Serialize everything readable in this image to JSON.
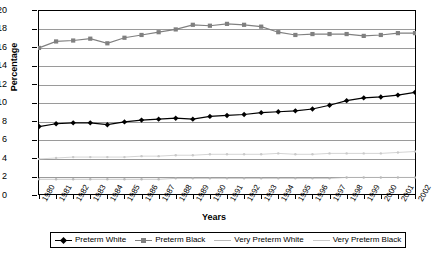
{
  "chart_data": {
    "type": "line",
    "title": "",
    "xlabel": "Years",
    "ylabel": "Percentage",
    "ylim": [
      0,
      20
    ],
    "ytick_step": 2,
    "yticks": [
      0,
      2,
      4,
      6,
      8,
      10,
      12,
      14,
      16,
      18,
      20
    ],
    "grid": true,
    "legend_position": "bottom",
    "categories": [
      "1980",
      "1981",
      "1982",
      "1983",
      "1984",
      "1985",
      "1986",
      "1987",
      "1988",
      "1989",
      "1990",
      "1991",
      "1992",
      "1993",
      "1994",
      "1995",
      "1996",
      "1997",
      "1998",
      "1999",
      "2000",
      "2001",
      "2002"
    ],
    "series": [
      {
        "name": "Preterm White",
        "color": "#000000",
        "marker": "diamond",
        "values": [
          7.4,
          7.7,
          7.8,
          7.8,
          7.6,
          7.9,
          8.1,
          8.2,
          8.3,
          8.2,
          8.5,
          8.6,
          8.7,
          8.9,
          9.0,
          9.1,
          9.3,
          9.7,
          10.2,
          10.5,
          10.6,
          10.8,
          11.1
        ]
      },
      {
        "name": "Preterm Black",
        "color": "#808080",
        "marker": "square",
        "values": [
          15.9,
          16.6,
          16.7,
          16.9,
          16.4,
          17.0,
          17.3,
          17.6,
          17.9,
          18.4,
          18.3,
          18.5,
          18.4,
          18.2,
          17.6,
          17.3,
          17.4,
          17.4,
          17.4,
          17.2,
          17.3,
          17.5,
          17.5
        ]
      },
      {
        "name": "Very Preterm White",
        "color": "#b9b9b9",
        "marker": "dot",
        "values": [
          1.7,
          1.7,
          1.7,
          1.7,
          1.7,
          1.7,
          1.7,
          1.7,
          1.8,
          1.8,
          1.8,
          1.8,
          1.8,
          1.8,
          1.8,
          1.8,
          1.8,
          1.8,
          1.9,
          1.9,
          1.9,
          1.9,
          1.9
        ]
      },
      {
        "name": "Very Preterm Black",
        "color": "#c9c9c9",
        "marker": "dot",
        "values": [
          3.9,
          4.0,
          4.1,
          4.1,
          4.1,
          4.1,
          4.2,
          4.2,
          4.3,
          4.3,
          4.4,
          4.4,
          4.4,
          4.4,
          4.5,
          4.4,
          4.4,
          4.5,
          4.5,
          4.5,
          4.5,
          4.6,
          4.7
        ]
      }
    ]
  }
}
